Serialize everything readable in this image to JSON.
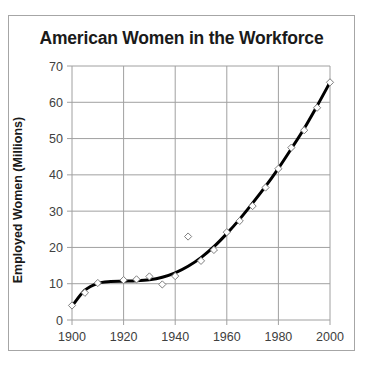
{
  "chart_data": {
    "type": "scatter",
    "title": "American Women in the Workforce",
    "xlabel": "",
    "ylabel": "Employed Women (Millions)",
    "xlim": [
      1900,
      2000
    ],
    "ylim": [
      0,
      70
    ],
    "x_ticks": [
      1900,
      1920,
      1940,
      1960,
      1980,
      2000
    ],
    "y_ticks": [
      0,
      10,
      20,
      30,
      40,
      50,
      60,
      70
    ],
    "grid": true,
    "legend": null,
    "series": [
      {
        "name": "Employed Women",
        "type": "scatter",
        "marker": "open-diamond",
        "x": [
          1900,
          1905,
          1910,
          1920,
          1925,
          1930,
          1935,
          1940,
          1945,
          1950,
          1955,
          1960,
          1965,
          1970,
          1975,
          1980,
          1985,
          1990,
          1995,
          2000
        ],
        "values": [
          4,
          7.5,
          10.2,
          11,
          11.2,
          12,
          9.8,
          12.1,
          23,
          16.3,
          19.3,
          24.2,
          27.3,
          31.4,
          36.5,
          41.7,
          47.5,
          52.3,
          58.5,
          65.5
        ]
      },
      {
        "name": "Trendline",
        "type": "line",
        "style": "smooth polynomial fit, thick black",
        "x": [
          1900,
          1905,
          1910,
          1915,
          1920,
          1925,
          1930,
          1935,
          1940,
          1945,
          1950,
          1955,
          1960,
          1965,
          1970,
          1975,
          1980,
          1985,
          1990,
          1995,
          2000
        ],
        "values": [
          3.8,
          8.2,
          10.1,
          10.6,
          10.7,
          10.8,
          11.1,
          11.8,
          13.0,
          14.8,
          17.2,
          20.2,
          23.8,
          27.8,
          32.2,
          36.8,
          41.8,
          47.2,
          52.8,
          59.0,
          65.5
        ]
      }
    ]
  },
  "colors": {
    "gridline": "#a0a0a0",
    "trendline": "#000000",
    "marker_stroke": "#7f7f7f",
    "frame_border": "#a6a6a6",
    "text": "#1a1a1a"
  }
}
